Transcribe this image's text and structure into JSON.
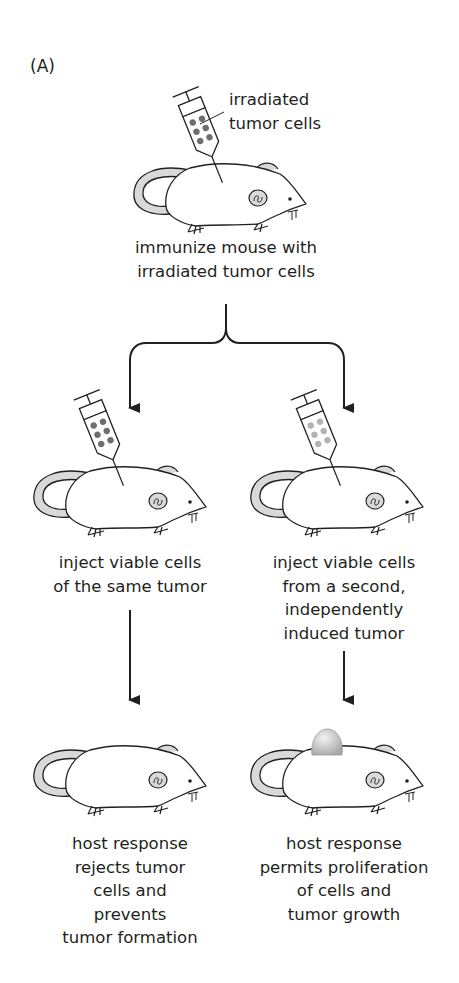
{
  "figure": {
    "panel_label": "(A)",
    "colors": {
      "line": "#231f20",
      "irradiated_cells": "#6d6e71",
      "same_tumor_cells": "#6d6e71",
      "second_tumor_cells": "#b3b3b3",
      "tail_fill": "#d9d9d9",
      "tumor_fill": "#cfcfcf",
      "background": "#ffffff"
    }
  },
  "step1": {
    "syringe_label": "irradiated\ntumor cells",
    "caption": "immunize mouse with\nirradiated tumor cells"
  },
  "branches": [
    {
      "id": "left",
      "inject_caption": "inject viable cells\nof the same tumor",
      "outcome_caption": "host response\nrejects tumor\ncells and\nprevents\ntumor formation",
      "tumor_visible": false
    },
    {
      "id": "right",
      "inject_caption": "inject viable cells\nfrom a second,\nindependently\ninduced tumor",
      "outcome_caption": "host response\npermits proliferation\nof cells and\ntumor growth",
      "tumor_visible": true
    }
  ]
}
